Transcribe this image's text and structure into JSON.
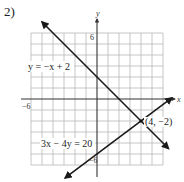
{
  "problem": {
    "number_label": "2)"
  },
  "chart_data": {
    "type": "line",
    "title": "",
    "xlabel": "x",
    "ylabel": "y",
    "xlim": [
      -6,
      6
    ],
    "ylim": [
      -6,
      6
    ],
    "grid": true,
    "x_tick_labels": [
      {
        "value": -6,
        "label": "−6"
      }
    ],
    "y_tick_labels": [
      {
        "value": 6,
        "label": "6"
      },
      {
        "value": -6,
        "label": "−6"
      }
    ],
    "series": [
      {
        "name": "y = −x + 2",
        "equation": "y = -x + 2",
        "slope": -1,
        "intercept": 2,
        "x_range": [
          -5.0,
          6.5
        ],
        "arrows": "both",
        "label": "y = −x + 2"
      },
      {
        "name": "3x − 4y = 20",
        "equation": "3x - 4y = 20",
        "slope": 0.75,
        "intercept": -5,
        "x_range": [
          -2.9,
          6.8
        ],
        "arrows": "both",
        "label": "3x − 4y = 20"
      }
    ],
    "annotations": [
      {
        "type": "point",
        "x": 4,
        "y": -2,
        "label": "(4, −2)"
      }
    ]
  }
}
